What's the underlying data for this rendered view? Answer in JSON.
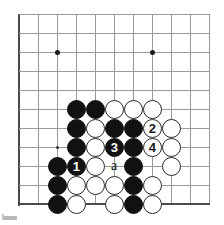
{
  "figure": {
    "kind": "go-board-diagram",
    "width": 224,
    "height": 225,
    "colors": {
      "background": "#ffffff",
      "grid": "#9a9a9a",
      "edge": "#4a4a4a",
      "black_stone": "#111111",
      "white_stone": "#ffffff",
      "stone_outline": "#2a2a2a",
      "label": "#111111"
    }
  },
  "board": {
    "origin_x": 19,
    "origin_y": 14,
    "spacing": 19,
    "cols": 11,
    "rows": 11,
    "left_edge_col": 0,
    "bottom_edge_row": 10,
    "star_points": [
      {
        "col": 2,
        "row": 2,
        "size": "large"
      },
      {
        "col": 7,
        "row": 2,
        "size": "large"
      },
      {
        "col": 2,
        "row": 7,
        "size": "small"
      }
    ]
  },
  "stones": [
    {
      "col": 3,
      "row": 5,
      "color": "black",
      "label": ""
    },
    {
      "col": 4,
      "row": 5,
      "color": "black",
      "label": ""
    },
    {
      "col": 5,
      "row": 5,
      "color": "white",
      "label": ""
    },
    {
      "col": 6,
      "row": 5,
      "color": "white",
      "label": ""
    },
    {
      "col": 7,
      "row": 5,
      "color": "white",
      "label": ""
    },
    {
      "col": 3,
      "row": 6,
      "color": "black",
      "label": ""
    },
    {
      "col": 4,
      "row": 6,
      "color": "white",
      "label": ""
    },
    {
      "col": 5,
      "row": 6,
      "color": "black",
      "label": ""
    },
    {
      "col": 6,
      "row": 6,
      "color": "black",
      "label": ""
    },
    {
      "col": 7,
      "row": 6,
      "color": "white",
      "label": "2"
    },
    {
      "col": 8,
      "row": 6,
      "color": "white",
      "label": ""
    },
    {
      "col": 3,
      "row": 7,
      "color": "black",
      "label": ""
    },
    {
      "col": 4,
      "row": 7,
      "color": "white",
      "label": ""
    },
    {
      "col": 5,
      "row": 7,
      "color": "black",
      "label": "3"
    },
    {
      "col": 6,
      "row": 7,
      "color": "black",
      "label": ""
    },
    {
      "col": 7,
      "row": 7,
      "color": "white",
      "label": "4"
    },
    {
      "col": 8,
      "row": 7,
      "color": "white",
      "label": ""
    },
    {
      "col": 2,
      "row": 8,
      "color": "black",
      "label": ""
    },
    {
      "col": 3,
      "row": 8,
      "color": "black",
      "label": "1"
    },
    {
      "col": 4,
      "row": 8,
      "color": "white",
      "label": ""
    },
    {
      "col": 6,
      "row": 8,
      "color": "black",
      "label": ""
    },
    {
      "col": 8,
      "row": 8,
      "color": "white",
      "label": ""
    },
    {
      "col": 2,
      "row": 9,
      "color": "black",
      "label": ""
    },
    {
      "col": 3,
      "row": 9,
      "color": "white",
      "label": ""
    },
    {
      "col": 4,
      "row": 9,
      "color": "white",
      "label": ""
    },
    {
      "col": 5,
      "row": 9,
      "color": "white",
      "label": ""
    },
    {
      "col": 6,
      "row": 9,
      "color": "black",
      "label": ""
    },
    {
      "col": 7,
      "row": 9,
      "color": "white",
      "label": ""
    },
    {
      "col": 2,
      "row": 10,
      "color": "black",
      "label": ""
    },
    {
      "col": 3,
      "row": 10,
      "color": "white",
      "label": ""
    },
    {
      "col": 5,
      "row": 10,
      "color": "white",
      "label": ""
    },
    {
      "col": 6,
      "row": 10,
      "color": "black",
      "label": ""
    },
    {
      "col": 7,
      "row": 10,
      "color": "white",
      "label": ""
    }
  ],
  "point_labels": [
    {
      "col": 5,
      "row": 8,
      "text": "a"
    }
  ]
}
